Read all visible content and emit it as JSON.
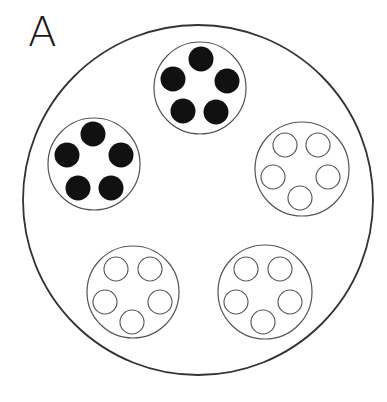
{
  "panel": {
    "label": "A"
  },
  "colors": {
    "outline": "#333333",
    "dish_outline": "#555555",
    "filled": "#111111",
    "empty": "#ffffff"
  },
  "outer_circle": {
    "cx": 198,
    "cy": 200,
    "r": 175
  },
  "dishes": [
    {
      "name": "dish-top",
      "state": "filled",
      "cx": 200,
      "cy": 88,
      "r": 46,
      "wells": [
        {
          "cx": 201,
          "cy": 59
        },
        {
          "cx": 227,
          "cy": 81
        },
        {
          "cx": 173,
          "cy": 79
        },
        {
          "cx": 183,
          "cy": 111
        },
        {
          "cx": 216,
          "cy": 112
        }
      ]
    },
    {
      "name": "dish-left",
      "state": "filled",
      "cx": 94,
      "cy": 164,
      "r": 46,
      "wells": [
        {
          "cx": 93,
          "cy": 134
        },
        {
          "cx": 121,
          "cy": 155
        },
        {
          "cx": 67,
          "cy": 155
        },
        {
          "cx": 78,
          "cy": 188
        },
        {
          "cx": 111,
          "cy": 188
        }
      ]
    },
    {
      "name": "dish-right",
      "state": "empty",
      "cx": 302,
      "cy": 169,
      "r": 47,
      "wells": [
        {
          "cx": 285,
          "cy": 145
        },
        {
          "cx": 318,
          "cy": 145
        },
        {
          "cx": 273,
          "cy": 177
        },
        {
          "cx": 328,
          "cy": 177
        },
        {
          "cx": 300,
          "cy": 198
        }
      ]
    },
    {
      "name": "dish-bottom-left",
      "state": "empty",
      "cx": 133,
      "cy": 292,
      "r": 46,
      "wells": [
        {
          "cx": 116,
          "cy": 269
        },
        {
          "cx": 150,
          "cy": 269
        },
        {
          "cx": 105,
          "cy": 302
        },
        {
          "cx": 160,
          "cy": 302
        },
        {
          "cx": 132,
          "cy": 322
        }
      ]
    },
    {
      "name": "dish-bottom-right",
      "state": "empty",
      "cx": 265,
      "cy": 292,
      "r": 47,
      "wells": [
        {
          "cx": 246,
          "cy": 269
        },
        {
          "cx": 280,
          "cy": 269
        },
        {
          "cx": 236,
          "cy": 302
        },
        {
          "cx": 290,
          "cy": 302
        },
        {
          "cx": 263,
          "cy": 322
        }
      ]
    }
  ],
  "well_radius": {
    "filled": 12.5,
    "empty": 12
  }
}
